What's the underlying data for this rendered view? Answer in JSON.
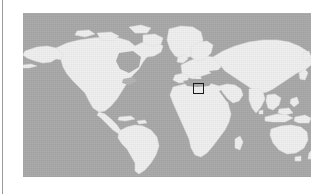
{
  "figure": {
    "kind": "world-locator-map",
    "caption": "",
    "background_color": "#ffffff"
  },
  "gutter": {
    "color": "#9a9a9a",
    "x": 2,
    "width": 1
  },
  "map": {
    "projection": "equirectangular",
    "ocean_color": "#a9a9a9",
    "land_color": "#f0f0f0",
    "land_edge_color": "#e3e3e3",
    "plate": {
      "x": 23,
      "y": 13,
      "width": 288,
      "height": 164
    },
    "lon_range": [
      -180,
      180
    ],
    "lat_range": [
      -60,
      84
    ],
    "graticule": false,
    "labels": []
  },
  "roi": {
    "label": "",
    "marker_shape": "square",
    "stroke_color": "#1a1a1a",
    "stroke_width": 1.5,
    "fill": "none",
    "region_described": "Eastern Mediterranean / Levant",
    "center_lon": 36,
    "center_lat": 32,
    "box": {
      "x": 193,
      "y": 83,
      "width": 11,
      "height": 11
    }
  },
  "chart_data": {
    "type": "map",
    "title": "",
    "xlabel": "",
    "ylabel": "",
    "landmasses": [
      "North America",
      "Greenland",
      "South America",
      "Europe",
      "Africa",
      "Asia",
      "Australia",
      "Indonesia / Southeast Asian archipelago",
      "Japan",
      "British Isles",
      "Madagascar",
      "New Zealand"
    ],
    "highlight": {
      "type": "bounding-box",
      "center_lon": 36,
      "center_lat": 32,
      "lon_span": 14,
      "lat_span": 10
    }
  }
}
